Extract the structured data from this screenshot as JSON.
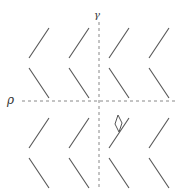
{
  "diagram": {
    "axes": {
      "vertical": {
        "label": "γ",
        "x": 99,
        "y1": 22,
        "y2": 188
      },
      "horizontal": {
        "label": "ρ",
        "y": 101,
        "x1": 22,
        "x2": 178
      }
    },
    "chevrons": {
      "tip_x": [
        29,
        69,
        109,
        149
      ],
      "rows": [
        {
          "upper_arm": [
            [
              49,
              28
            ],
            [
              29,
              58
            ]
          ],
          "lower_arm": [
            [
              29,
              68
            ],
            [
              49,
              98
            ]
          ]
        },
        {
          "upper_arm": [
            [
              49,
              118
            ],
            [
              29,
              148
            ]
          ],
          "lower_arm": [
            [
              29,
              158
            ],
            [
              49,
              188
            ]
          ]
        }
      ]
    },
    "marker": {
      "type": "diamond",
      "center": [
        119,
        125
      ]
    },
    "colors": {
      "line": "#555555",
      "dash": "#888888",
      "background": "#ffffff"
    }
  }
}
